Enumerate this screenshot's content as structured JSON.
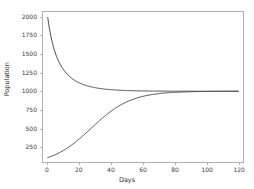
{
  "chart_data": {
    "type": "line",
    "title": "",
    "xlabel": "Days",
    "ylabel": "Population",
    "xlim": [
      -3,
      123
    ],
    "ylim": [
      40,
      2075
    ],
    "grid": false,
    "legend": null,
    "xticks": [
      0,
      20,
      40,
      60,
      80,
      100,
      120
    ],
    "xtick_labels": [
      "0",
      "20",
      "40",
      "60",
      "80",
      "100",
      "120"
    ],
    "yticks": [
      250,
      500,
      750,
      1000,
      1250,
      1500,
      1750,
      2000
    ],
    "ytick_labels": [
      "250",
      "500",
      "750",
      "1000",
      "1250",
      "1500",
      "1750",
      "2000"
    ],
    "line_color": "#4a4a4a",
    "carrying_capacity": 1000,
    "x": [
      0,
      5,
      10,
      15,
      20,
      25,
      30,
      35,
      40,
      45,
      50,
      55,
      60,
      65,
      70,
      75,
      80,
      85,
      90,
      95,
      100,
      105,
      110,
      115,
      120
    ],
    "series": [
      {
        "name": "Growth from P0 = 100",
        "initial_population": 100,
        "values": [
          100,
          122,
          148,
          179,
          215,
          258,
          307,
          363,
          426,
          495,
          569,
          646,
          723,
          796,
          862,
          901,
          926,
          945,
          959,
          969,
          977,
          982,
          986,
          989,
          992
        ]
      },
      {
        "name": "Decay from P0 = 2000",
        "initial_population": 2000,
        "values": [
          2000,
          1800,
          1640,
          1512,
          1410,
          1328,
          1263,
          1211,
          1170,
          1137,
          1110,
          1089,
          1072,
          1058,
          1047,
          1038,
          1031,
          1025,
          1021,
          1017,
          1014,
          1011,
          1009,
          1008,
          1006
        ]
      }
    ]
  }
}
